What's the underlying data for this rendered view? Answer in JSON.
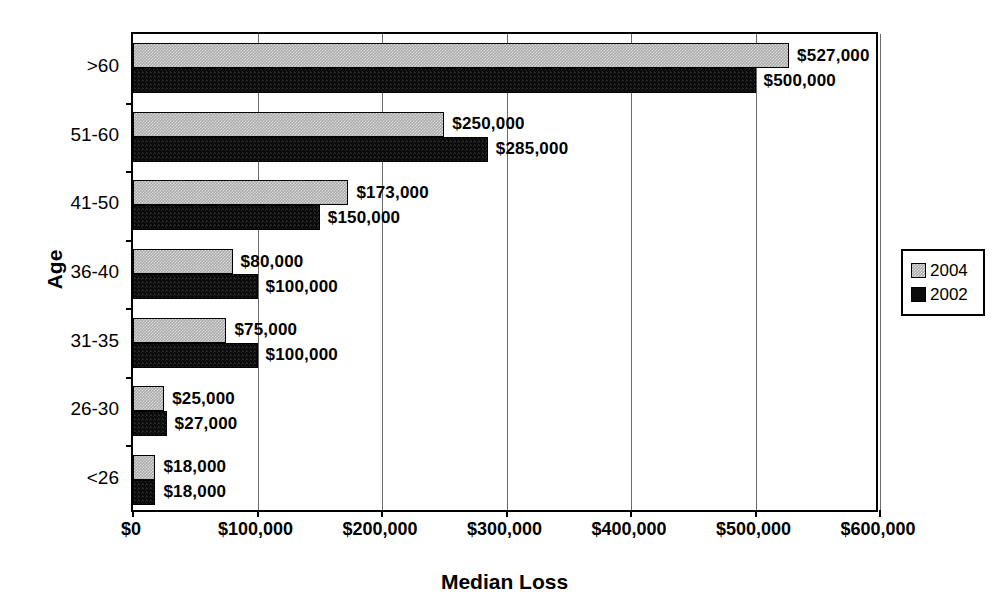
{
  "chart_data": {
    "type": "bar",
    "orientation": "horizontal",
    "title": "",
    "xlabel": "Median Loss",
    "ylabel": "Age",
    "categories": [
      ">60",
      "51-60",
      "41-50",
      "36-40",
      "31-35",
      "26-30",
      "<26"
    ],
    "series": [
      {
        "name": "2004",
        "color": "#a8a8a8",
        "values": [
          527000,
          250000,
          173000,
          80000,
          75000,
          25000,
          18000
        ],
        "labels": [
          "$527,000",
          "$250,000",
          "$173,000",
          "$80,000",
          "$75,000",
          "$25,000",
          "$18,000"
        ]
      },
      {
        "name": "2002",
        "color": "#000000",
        "values": [
          500000,
          285000,
          150000,
          100000,
          100000,
          27000,
          18000
        ],
        "labels": [
          "$500,000",
          "$285,000",
          "$150,000",
          "$100,000",
          "$100,000",
          "$27,000",
          "$18,000"
        ]
      }
    ],
    "xlim": [
      0,
      600000
    ],
    "xticks": [
      0,
      100000,
      200000,
      300000,
      400000,
      500000,
      600000
    ],
    "xtick_labels": [
      "$0",
      "$100,000",
      "$200,000",
      "$300,000",
      "$400,000",
      "$500,000",
      "$600,000"
    ],
    "grid": "vertical",
    "legend_position": "right"
  },
  "legend": {
    "entries": [
      {
        "label": "2004"
      },
      {
        "label": "2002"
      }
    ]
  },
  "axes": {
    "x_title": "Median Loss",
    "y_title": "Age"
  }
}
